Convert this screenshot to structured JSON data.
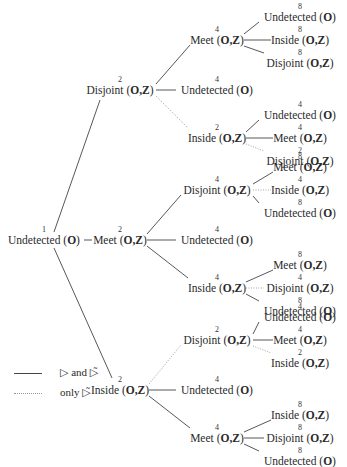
{
  "diagram": {
    "type": "tree",
    "root": {
      "label": "Undetected",
      "arg": "O",
      "count": "1",
      "children": [
        {
          "edge": "solid",
          "label": "Disjoint",
          "arg": "O,Z",
          "count": "2",
          "children": [
            {
              "edge": "solid",
              "label": "Meet",
              "arg": "O,Z",
              "count": "4",
              "children": [
                {
                  "edge": "solid",
                  "label": "Undetected",
                  "arg": "O",
                  "count": "8"
                },
                {
                  "edge": "solid",
                  "label": "Inside",
                  "arg": "O,Z",
                  "count": "8"
                },
                {
                  "edge": "solid",
                  "label": "Disjoint",
                  "arg": "O,Z",
                  "count": "8"
                }
              ]
            },
            {
              "edge": "solid",
              "label": "Undetected",
              "arg": "O",
              "count": "4"
            },
            {
              "edge": "dotted",
              "label": "Inside",
              "arg": "O,Z",
              "count": "2",
              "children": [
                {
                  "edge": "solid",
                  "label": "Undetected",
                  "arg": "O",
                  "count": "4"
                },
                {
                  "edge": "solid",
                  "label": "Meet",
                  "arg": "O,Z",
                  "count": "4"
                },
                {
                  "edge": "dotted",
                  "label": "Disjoint",
                  "arg": "O,Z",
                  "count": "2"
                }
              ]
            }
          ]
        },
        {
          "edge": "solid",
          "label": "Meet",
          "arg": "O,Z",
          "count": "2",
          "children": [
            {
              "edge": "solid",
              "label": "Disjoint",
              "arg": "O,Z",
              "count": "4",
              "children": [
                {
                  "edge": "solid",
                  "label": "Meet",
                  "arg": "O,Z",
                  "count": "8"
                },
                {
                  "edge": "dotted",
                  "label": "Inside",
                  "arg": "O,Z",
                  "count": "4"
                },
                {
                  "edge": "solid",
                  "label": "Undetected",
                  "arg": "O",
                  "count": "8"
                }
              ]
            },
            {
              "edge": "solid",
              "label": "Undetected",
              "arg": "O",
              "count": "4"
            },
            {
              "edge": "solid",
              "label": "Inside",
              "arg": "O,Z",
              "count": "4",
              "children": [
                {
                  "edge": "solid",
                  "label": "Meet",
                  "arg": "O,Z",
                  "count": "8"
                },
                {
                  "edge": "dotted",
                  "label": "Disjoint",
                  "arg": "O,Z",
                  "count": "4"
                },
                {
                  "edge": "solid",
                  "label": "Undetected",
                  "arg": "O",
                  "count": "8"
                }
              ]
            }
          ]
        },
        {
          "edge": "solid",
          "label": "Inside",
          "arg": "O,Z",
          "count": "2",
          "children": [
            {
              "edge": "dotted",
              "label": "Disjoint",
              "arg": "O,Z",
              "count": "2",
              "children": [
                {
                  "edge": "solid",
                  "label": "Undetected",
                  "arg": "O",
                  "count": "4"
                },
                {
                  "edge": "solid",
                  "label": "Meet",
                  "arg": "O,Z",
                  "count": "4"
                },
                {
                  "edge": "dotted",
                  "label": "Inside",
                  "arg": "O,Z",
                  "count": "2"
                }
              ]
            },
            {
              "edge": "solid",
              "label": "Undetected",
              "arg": "O",
              "count": "4"
            },
            {
              "edge": "solid",
              "label": "Meet",
              "arg": "O,Z",
              "count": "4",
              "children": [
                {
                  "edge": "solid",
                  "label": "Inside",
                  "arg": "O,Z",
                  "count": "8"
                },
                {
                  "edge": "solid",
                  "label": "Disjoint",
                  "arg": "O,Z",
                  "count": "8"
                },
                {
                  "edge": "solid",
                  "label": "Undetected",
                  "arg": "O",
                  "count": "8"
                }
              ]
            }
          ]
        }
      ]
    }
  },
  "legend": {
    "items": [
      {
        "style": "solid",
        "text": "▷ and ▷̃"
      },
      {
        "style": "dotted",
        "text": "only ▷̃"
      }
    ]
  },
  "colors": {
    "text": "#2a2a2a",
    "solid_edge": "#444444",
    "dotted_edge": "#9a9a9a"
  }
}
